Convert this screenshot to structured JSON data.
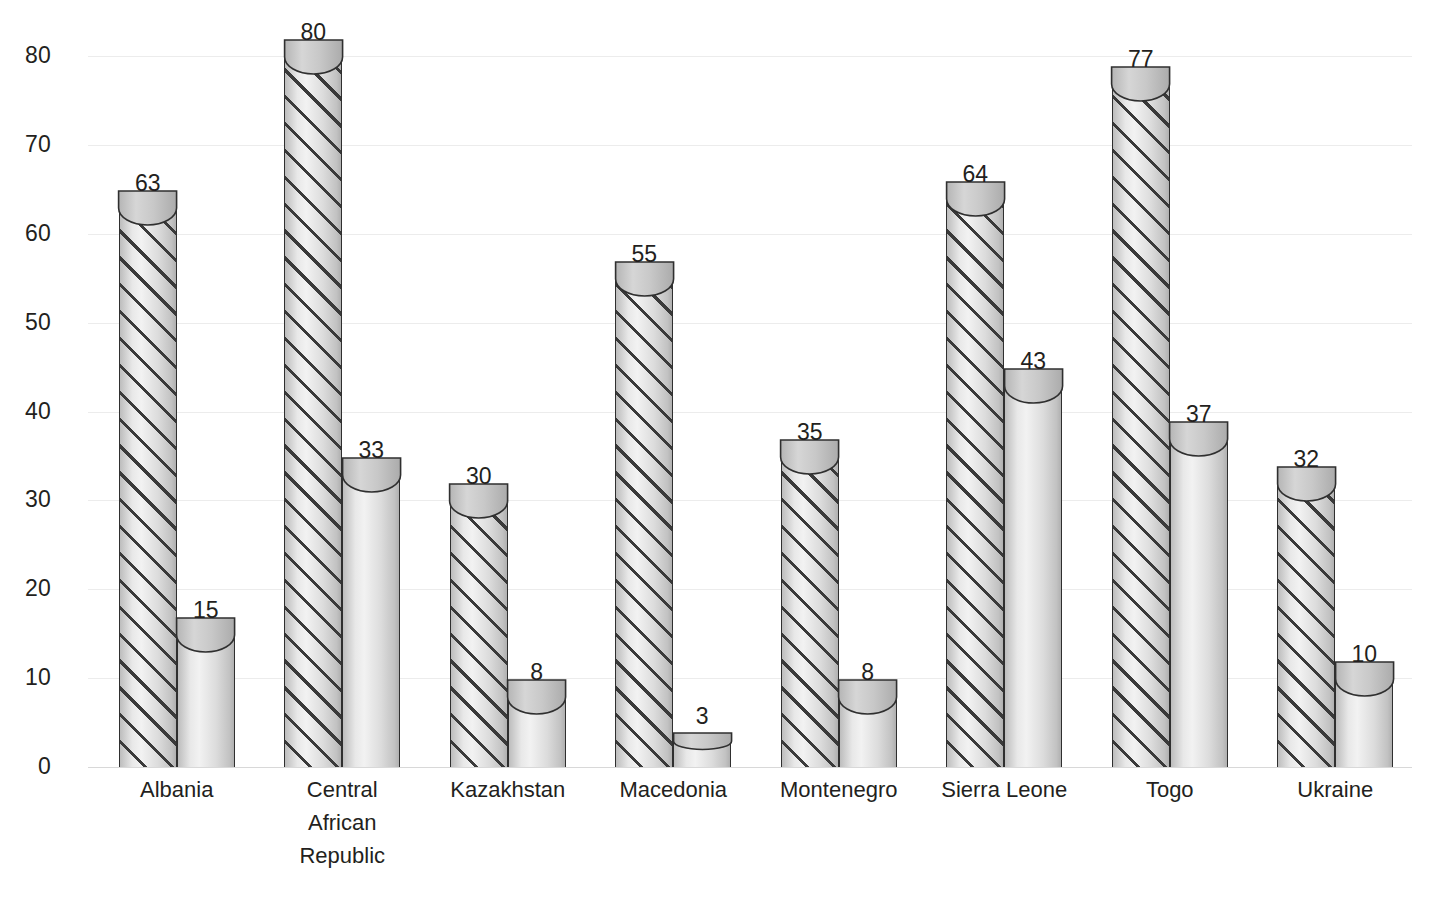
{
  "chart_data": {
    "type": "bar",
    "title": "",
    "subtitle": "",
    "xlabel": "",
    "ylabel": "",
    "ylim": [
      0,
      80
    ],
    "ytick_step": 10,
    "yticks": [
      80,
      70,
      60,
      50,
      40,
      30,
      20,
      10,
      0
    ],
    "grid": true,
    "grid_axis": "y",
    "legend": false,
    "legend_position": "none",
    "bar_style": "3d-cylinder",
    "categories": [
      "Albania",
      "Central\nAfrican\nRepublic",
      "Kazakhstan",
      "Macedonia",
      "Montenegro",
      "Sierra Leone",
      "Togo",
      "Ukraine"
    ],
    "series": [
      {
        "name": "series-1",
        "fill": "diagonal-hatch",
        "values": [
          63,
          80,
          30,
          55,
          35,
          64,
          77,
          32
        ]
      },
      {
        "name": "series-2",
        "fill": "solid-gray",
        "values": [
          15,
          33,
          8,
          3,
          8,
          43,
          37,
          10
        ]
      }
    ],
    "data_labels": {
      "show": true,
      "series_1": [
        "63",
        "80",
        "30",
        "55",
        "35",
        "64",
        "77",
        "32"
      ],
      "series_2": [
        "15",
        "33",
        "8",
        "3",
        "8",
        "43",
        "37",
        "10"
      ]
    }
  },
  "colors": {
    "gridline": "#ececec",
    "baseline": "#d8d8d8",
    "bar_outline": "#2f2f2f",
    "hatch_line": "#3a3a3a",
    "text": "#231f20",
    "background": "#ffffff"
  }
}
